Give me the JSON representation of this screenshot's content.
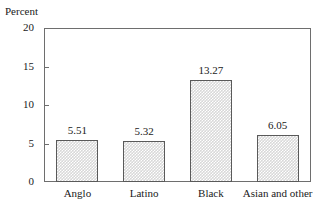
{
  "chart_data": {
    "type": "bar",
    "title": "",
    "subtitle": "",
    "xlabel": "",
    "ylabel": "Percent",
    "categories": [
      "Anglo",
      "Latino",
      "Black",
      "Asian and other"
    ],
    "values": [
      5.51,
      5.32,
      13.27,
      6.05
    ],
    "value_labels": [
      "5.51",
      "5.32",
      "13.27",
      "6.05"
    ],
    "ylim": [
      0,
      20
    ],
    "yticks": [
      0,
      5,
      10,
      15,
      20
    ],
    "ytick_labels": [
      "0",
      "5",
      "10",
      "15",
      "20"
    ],
    "grid": false,
    "legend": null,
    "legend_position": "none",
    "bar_fill_color": "#d8d8d8",
    "bar_fill_pattern": "fine-checker-dither",
    "bar_edge_color": "#5a5a5a",
    "frame_color": "#6e6e6e",
    "background_color": "#ffffff",
    "text_color": "#1a1a1a"
  },
  "axis": {
    "y_title": "Percent"
  }
}
